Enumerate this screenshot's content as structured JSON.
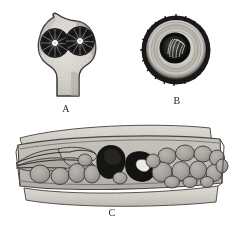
{
  "figure": {
    "kind": "scientific-illustration-plate",
    "style": "halftone-engraving",
    "background_color": "#ffffff",
    "ink_color": "#2b2b2b",
    "panel_count": 3
  },
  "panels": [
    {
      "id": "A",
      "label": "A",
      "name": "panel-a-flask-shaped-body",
      "description": "Flask or shield shaped body, pointed apex at upper left, broad upper chamber narrowing to a stalk below, containing two dark radiating rosette bodies with white centres",
      "fill_color": "#d7d4cf",
      "outline_color": "#3a3a3a",
      "inclusion_count": 2,
      "inclusion_color": "#1c1c1c",
      "inclusion_center_color": "#ffffff",
      "caption_position": {
        "x": 66,
        "y": 105
      }
    },
    {
      "id": "B",
      "label": "B",
      "name": "panel-b-circular-cyst",
      "description": "Circular cyst in surface view, dark crenulate outer rim, concentric pale rings, dark ringed inner core with wispy striated contents",
      "rim_color": "#1e1e1e",
      "ring_color": "#b9b5ae",
      "core_color": "#141414",
      "core_contents_color": "#e8e6e2",
      "caption_position": {
        "x": 177,
        "y": 97
      }
    },
    {
      "id": "C",
      "label": "C",
      "name": "panel-c-tissue-cross-section",
      "description": "Transverse section of a band of tissue; curved pale epidermal bands above and below enclose a row of rounded packed cells, an elongate vascular strand at the left, and two very dark bodies near the centre, one solid and one ring shaped with a pale lumen",
      "band_color": "#cfccc6",
      "interior_color": "#c3bfb9",
      "cell_color": "#a9a5a0",
      "cell_outline_color": "#3c3c3c",
      "dark_body_color": "#141414",
      "cell_count": 28,
      "dark_body_count": 2,
      "caption_position": {
        "x": 112,
        "y": 209
      }
    }
  ],
  "captions": {
    "a": "A",
    "b": "B",
    "c": "C"
  }
}
